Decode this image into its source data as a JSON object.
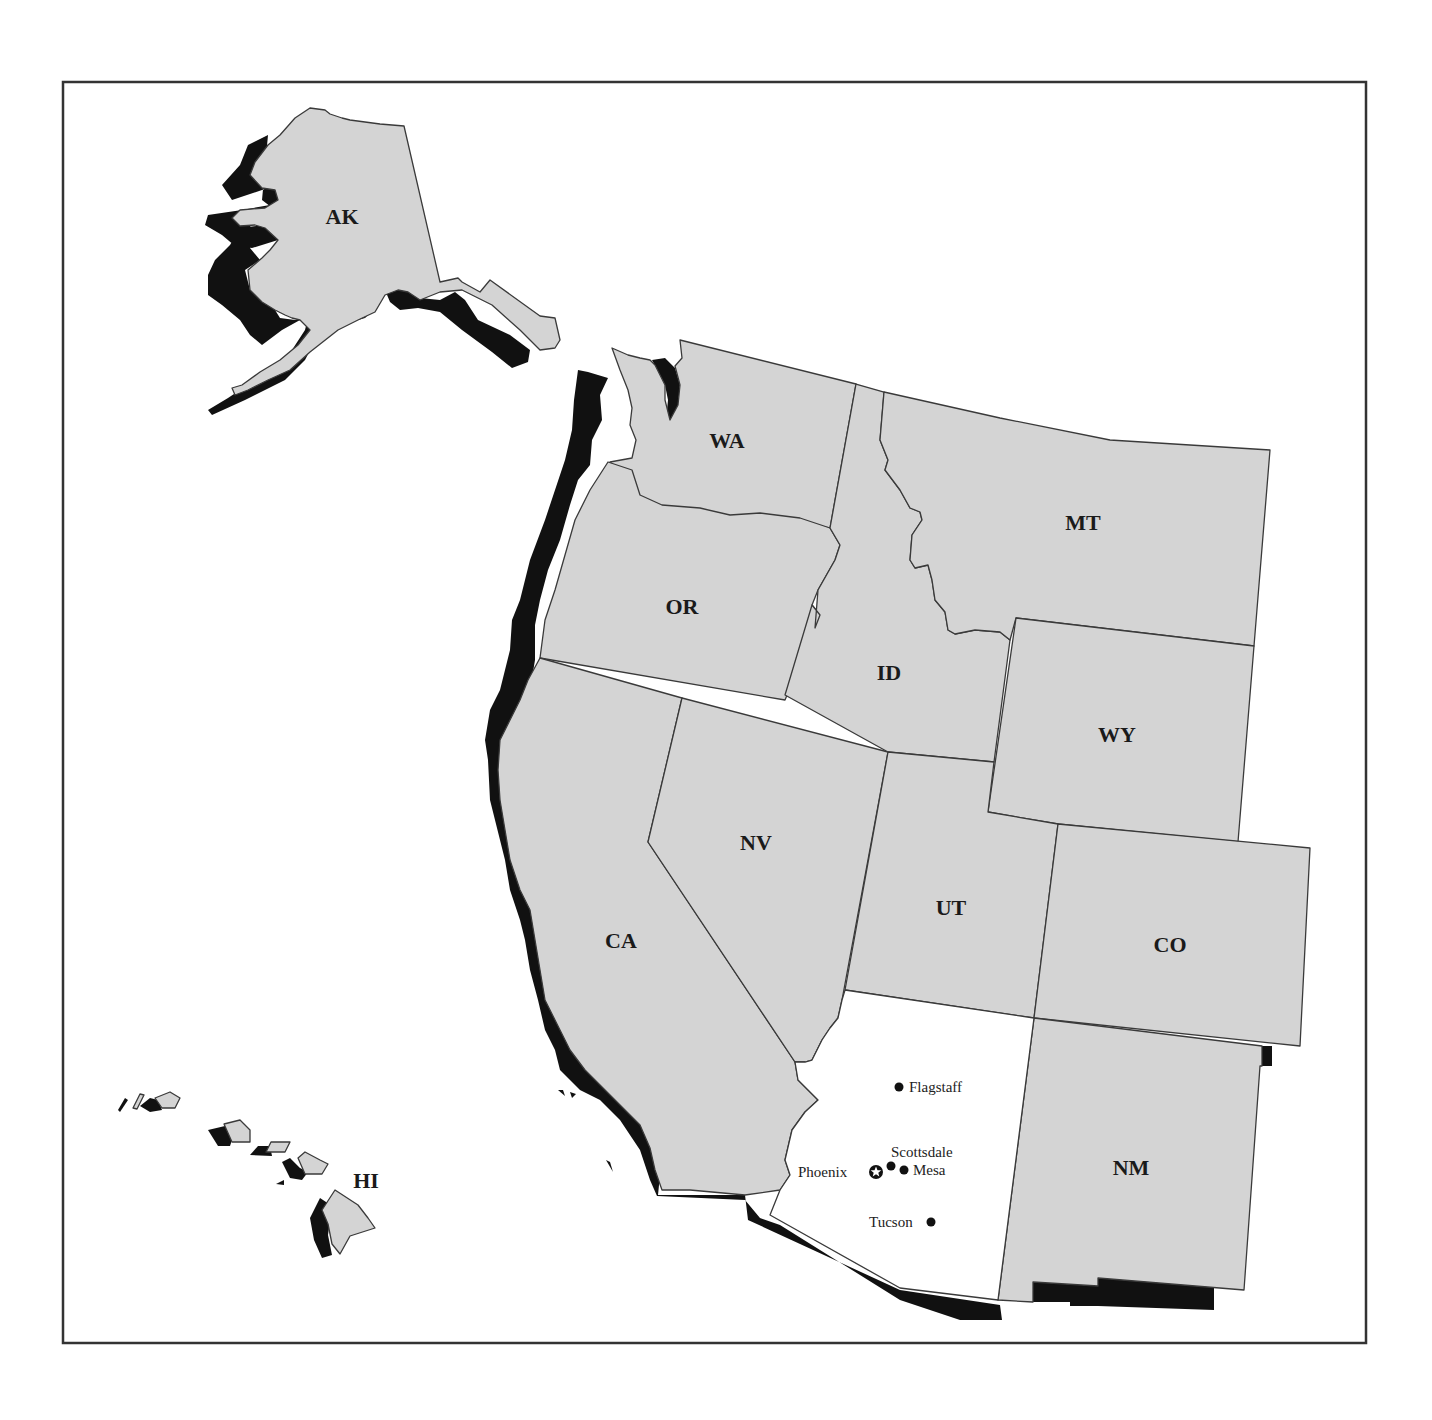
{
  "map": {
    "title": "",
    "highlighted_state": "AZ",
    "colors": {
      "state_fill": "#d4d4d4",
      "highlight_fill": "#ffffff",
      "shadow": "#111111",
      "border": "#3a3a3a",
      "frame": "#333333"
    },
    "states": [
      {
        "abbr": "AK",
        "label": "AK"
      },
      {
        "abbr": "HI",
        "label": "HI"
      },
      {
        "abbr": "WA",
        "label": "WA"
      },
      {
        "abbr": "OR",
        "label": "OR"
      },
      {
        "abbr": "CA",
        "label": "CA"
      },
      {
        "abbr": "NV",
        "label": "NV"
      },
      {
        "abbr": "ID",
        "label": "ID"
      },
      {
        "abbr": "MT",
        "label": "MT"
      },
      {
        "abbr": "WY",
        "label": "WY"
      },
      {
        "abbr": "UT",
        "label": "UT"
      },
      {
        "abbr": "CO",
        "label": "CO"
      },
      {
        "abbr": "NM",
        "label": "NM"
      },
      {
        "abbr": "AZ",
        "label": ""
      }
    ],
    "cities": [
      {
        "name": "Flagstaff",
        "type": "city"
      },
      {
        "name": "Scottsdale",
        "type": "city"
      },
      {
        "name": "Mesa",
        "type": "city"
      },
      {
        "name": "Phoenix",
        "type": "capital"
      },
      {
        "name": "Tucson",
        "type": "city"
      }
    ]
  }
}
